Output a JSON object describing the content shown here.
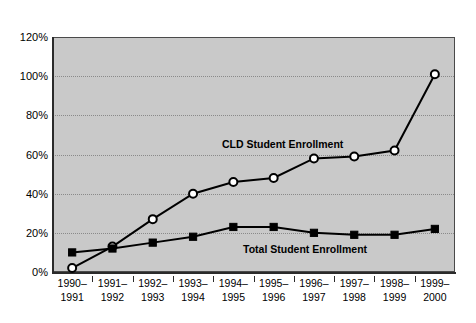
{
  "chart_data": {
    "type": "line",
    "title": "",
    "xlabel": "",
    "ylabel": "",
    "ylim": [
      0,
      120
    ],
    "ytick_values": [
      0,
      20,
      40,
      60,
      80,
      100,
      120
    ],
    "ytick_labels": [
      "0%",
      "20%",
      "40%",
      "60%",
      "80%",
      "100%",
      "120%"
    ],
    "grid": "horizontal-dotted",
    "legend": "inline-annotations",
    "categories": [
      "1990-1991",
      "1991-1992",
      "1992-1993",
      "1993-1994",
      "1994-1995",
      "1995-1996",
      "1996-1997",
      "1997-1998",
      "1998-1999",
      "1999-2000"
    ],
    "category_lines": [
      [
        "1990–",
        "1991"
      ],
      [
        "1991–",
        "1992"
      ],
      [
        "1992–",
        "1993"
      ],
      [
        "1993–",
        "1994"
      ],
      [
        "1994–",
        "1995"
      ],
      [
        "1995–",
        "1996"
      ],
      [
        "1996–",
        "1997"
      ],
      [
        "1997–",
        "1998"
      ],
      [
        "1998–",
        "1999"
      ],
      [
        "1999–",
        "2000"
      ]
    ],
    "series": [
      {
        "name": "CLD Student Enrollment",
        "marker": "open-circle",
        "color": "#000000",
        "values": [
          2,
          13,
          27,
          40,
          46,
          48,
          58,
          59,
          62,
          101
        ]
      },
      {
        "name": "Total Student Enrollment",
        "marker": "filled-square",
        "color": "#000000",
        "values": [
          10,
          12,
          15,
          18,
          23,
          23,
          20,
          19,
          19,
          22
        ]
      }
    ],
    "annotations": [
      {
        "text": "CLD Student Enrollment",
        "series": "CLD Student Enrollment"
      },
      {
        "text": "Total Student Enrollment",
        "series": "Total Student Enrollment"
      }
    ],
    "colors": {
      "plot_background": "#c9c9c9",
      "gridline": "#8a8a8a",
      "axis": "#2b2b2b",
      "series_line": "#000000",
      "page_background": "#ffffff"
    }
  }
}
